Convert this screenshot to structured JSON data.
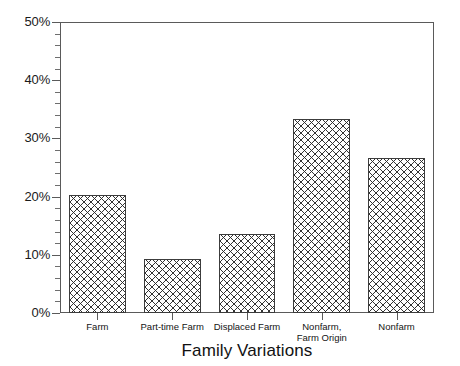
{
  "chart_data": {
    "type": "bar",
    "title": "",
    "xlabel": "Family Variations",
    "ylabel": "",
    "categories": [
      "Farm",
      "Part-time Farm",
      "Displaced Farm",
      "Nonfarm,\nFarm Origin",
      "Nonfarm"
    ],
    "values": [
      20.3,
      9.3,
      13.6,
      33.3,
      26.6
    ],
    "ylim": [
      0,
      50
    ],
    "ytick_labels": [
      "0%",
      "10%",
      "20%",
      "30%",
      "40%",
      "50%"
    ],
    "ytick_values": [
      0,
      10,
      20,
      30,
      40,
      50
    ],
    "yminor_step": 2,
    "grid": false,
    "legend": null,
    "bar_fill": "crosshatch",
    "bar_edge_color": "#3c3c3c",
    "axis_color": "#5a5a5a",
    "background": "#ffffff"
  },
  "axis": {
    "y_labels": [
      {
        "text": "50%",
        "value": 50
      },
      {
        "text": "40%",
        "value": 40
      },
      {
        "text": "30%",
        "value": 30
      },
      {
        "text": "20%",
        "value": 20
      },
      {
        "text": "10%",
        "value": 10
      },
      {
        "text": "0%",
        "value": 0
      }
    ],
    "x_title": "Family Variations"
  }
}
